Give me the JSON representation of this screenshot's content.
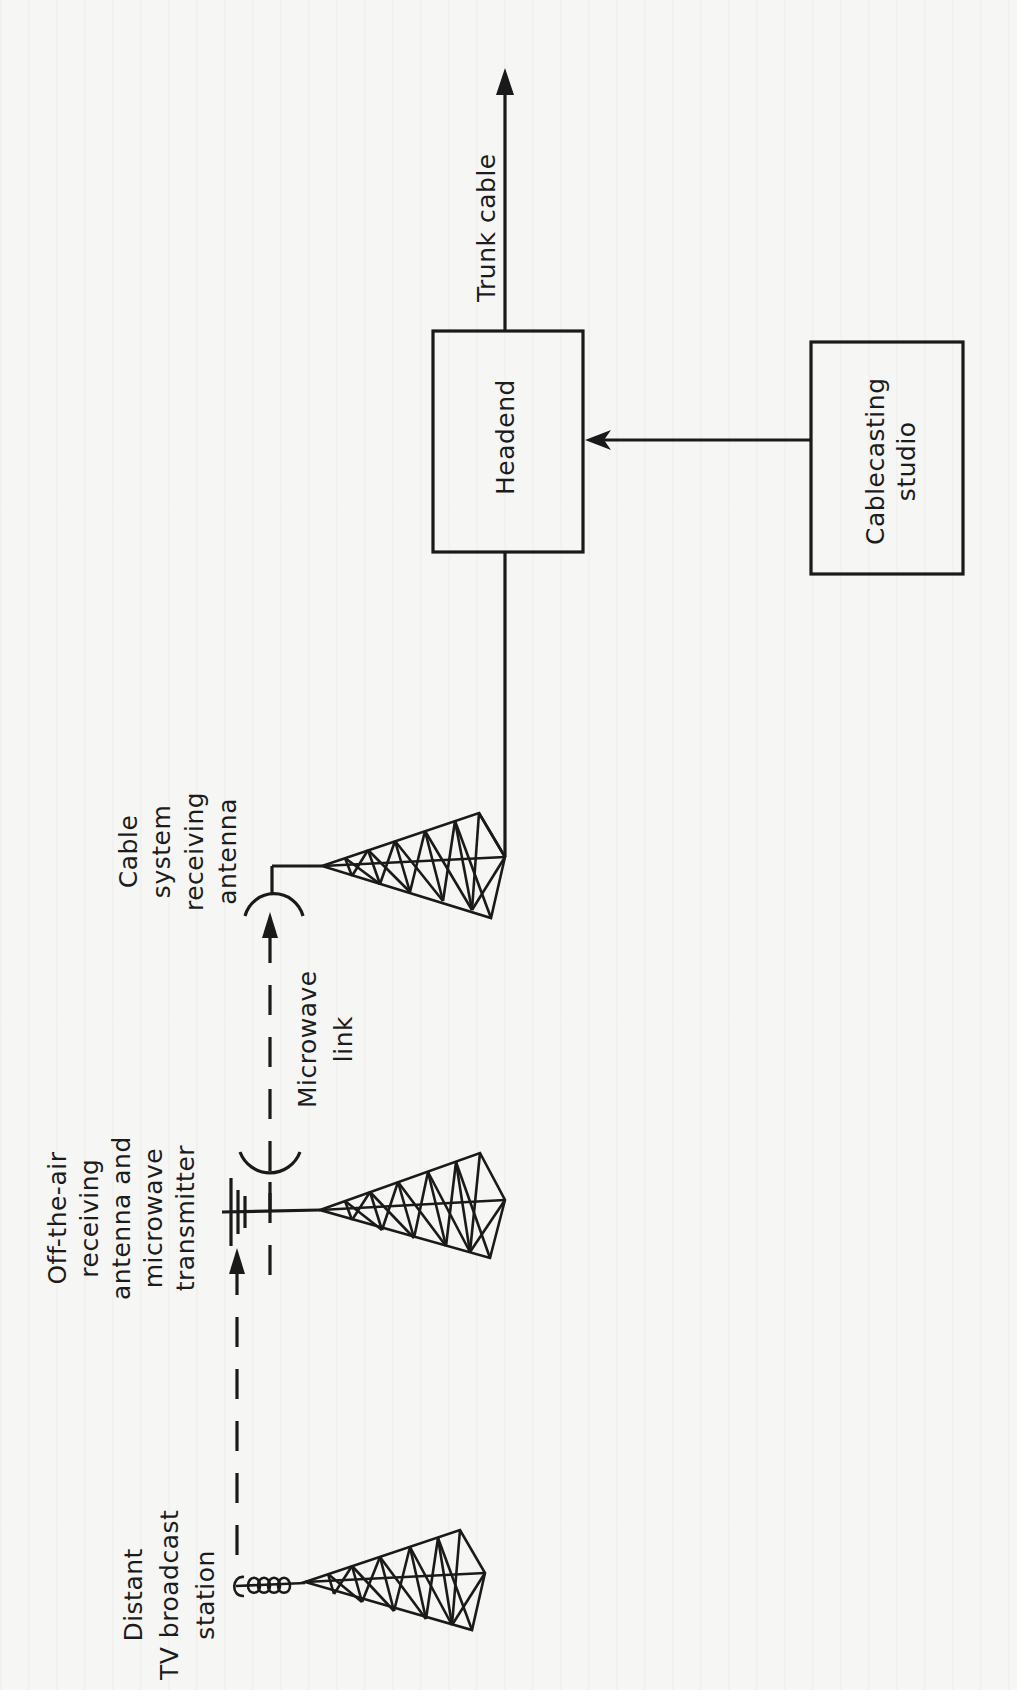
{
  "diagram": {
    "orientation": "rotated -90deg (landscape figure printed on portrait page)",
    "colors": {
      "ink": "#1a1a1a",
      "paper": "#f6f6f4"
    },
    "nodes": {
      "distant_station": {
        "lines": [
          "Distant",
          "TV broadcast",
          "station"
        ],
        "icon": "broadcast-tower-with-helical-antenna"
      },
      "offair_transmitter": {
        "lines": [
          "Off-the-air",
          "receiving",
          "antenna and",
          "microwave",
          "transmitter"
        ],
        "icon": "tower-with-yagi-and-dish"
      },
      "microwave_link": {
        "lines": [
          "Microwave",
          "link"
        ]
      },
      "cable_receiver": {
        "lines": [
          "Cable",
          "system",
          "receiving",
          "antenna"
        ],
        "icon": "tower-with-dish"
      },
      "headend": {
        "label": "Headend"
      },
      "studio": {
        "lines": [
          "Cablecasting",
          "studio"
        ]
      },
      "trunk_cable": {
        "label": "Trunk cable"
      }
    },
    "edges": [
      {
        "from": "distant_station",
        "to": "offair_transmitter",
        "style": "dashed-arrow"
      },
      {
        "from": "offair_transmitter",
        "to": "cable_receiver",
        "style": "dashed-arrow",
        "label": "Microwave link"
      },
      {
        "from": "cable_receiver",
        "to": "headend",
        "style": "solid-line"
      },
      {
        "from": "studio",
        "to": "headend",
        "style": "solid-arrow"
      },
      {
        "from": "headend",
        "to": "trunk_cable",
        "style": "solid-arrow"
      }
    ]
  }
}
